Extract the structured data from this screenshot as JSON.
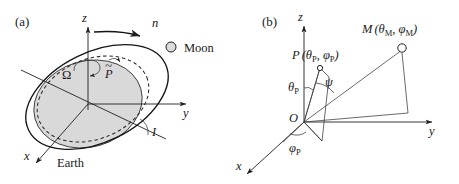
{
  "figure": {
    "background_color": "#ffffff",
    "ink_color": "#1a1a1a",
    "shade_color": "#d9d9d9"
  },
  "panel_a": {
    "panel_label": "(a)",
    "axes": [
      {
        "name": "z-axis",
        "label": "z"
      },
      {
        "name": "y-axis",
        "label": "y"
      },
      {
        "name": "x-axis",
        "label": "x"
      }
    ],
    "labels": {
      "node_regression": "Ω",
      "perigee_precession": "P",
      "perigee_tilde": "~",
      "mean_motion": "n",
      "inclination": "I",
      "moon": "Moon",
      "earth": "Earth"
    },
    "elements": [
      "equatorial-plane-disk",
      "ecliptic-dashed-ellipse",
      "lunar-orbit-ellipse",
      "line-of-nodes",
      "moon-marker",
      "precession-arrow",
      "node-regression-arrow",
      "orbit-direction-arrow"
    ]
  },
  "panel_b": {
    "panel_label": "(b)",
    "axes": [
      {
        "name": "z-axis",
        "label": "z"
      },
      {
        "name": "y-axis",
        "label": "y"
      },
      {
        "name": "x-axis",
        "label": "x"
      }
    ],
    "points": [
      {
        "name": "origin",
        "label": "O"
      },
      {
        "name": "point-P",
        "label": "P",
        "coords_open": "(",
        "theta": "θ",
        "theta_sub": "P",
        "comma": ", ",
        "phi": "φ",
        "phi_sub": "P",
        "coords_close": ")"
      },
      {
        "name": "point-M",
        "label": "M",
        "coords_open": "(",
        "theta": "θ",
        "theta_sub": "M",
        "comma": ", ",
        "phi": "φ",
        "phi_sub": "M",
        "coords_close": ")"
      }
    ],
    "angles": [
      {
        "name": "polar-angle-P",
        "symbol": "θ",
        "subscript": "P"
      },
      {
        "name": "azimuth-angle-P",
        "symbol": "φ",
        "subscript": "P"
      },
      {
        "name": "separation-angle",
        "symbol": "ψ",
        "subscript": ""
      }
    ],
    "elements": [
      "vertical-meridian-quad",
      "line-O-to-P",
      "line-O-to-M",
      "projection-line-M",
      "horizontal-base-line",
      "angle-arc-theta-P",
      "angle-arc-phi-P",
      "angle-arc-psi",
      "P-marker",
      "M-marker"
    ]
  }
}
